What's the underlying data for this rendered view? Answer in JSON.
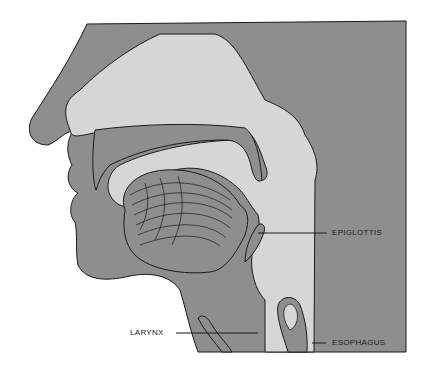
{
  "diagram": {
    "title": "",
    "colors": {
      "tissue": "#8e8e8e",
      "cavity": "#d6d6d6",
      "outline": "#1a1a1a",
      "background": "#ffffff"
    },
    "labels": [
      {
        "id": "epiglottis",
        "text": "EPIGLOTTIS"
      },
      {
        "id": "larynx",
        "text": "LARYNX"
      },
      {
        "id": "esophagus",
        "text": "ESOPHAGUS"
      }
    ]
  }
}
